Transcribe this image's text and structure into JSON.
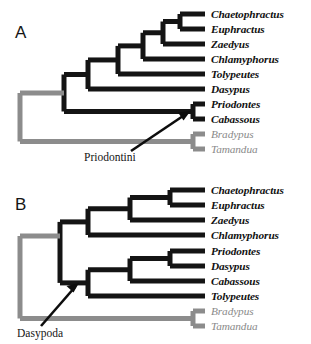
{
  "figure": {
    "type": "cladogram-pair",
    "colors": {
      "ingroup_branch": "#141414",
      "outgroup_branch": "#8c8c8c",
      "ingroup_text": "#111111",
      "outgroup_text": "#8a8a8a",
      "background": "#ffffff"
    }
  },
  "panels": [
    {
      "id": "A",
      "letter": "A",
      "clade_annotation": {
        "label": "Priodontini",
        "points_to": "Priodontes + Cabassous node"
      },
      "tips": [
        {
          "name": "Chaetophractus",
          "group": "ingroup"
        },
        {
          "name": "Euphractus",
          "group": "ingroup"
        },
        {
          "name": "Zaedyus",
          "group": "ingroup"
        },
        {
          "name": "Chlamyphorus",
          "group": "ingroup"
        },
        {
          "name": "Tolypeutes",
          "group": "ingroup"
        },
        {
          "name": "Dasypus",
          "group": "ingroup"
        },
        {
          "name": "Priodontes",
          "group": "ingroup"
        },
        {
          "name": "Cabassous",
          "group": "ingroup"
        },
        {
          "name": "Bradypus",
          "group": "outgroup"
        },
        {
          "name": "Tamandua",
          "group": "outgroup"
        }
      ],
      "newick": "((((((Chaetophractus,Euphractus),Zaedyus),Chlamyphorus),Tolypeutes),Dasypus),(Priodontes,Cabassous)),(Bradypus,Tamandua));"
    },
    {
      "id": "B",
      "letter": "B",
      "clade_annotation": {
        "label": "Dasypoda",
        "points_to": "base of the armadillo ingroup clade"
      },
      "tips": [
        {
          "name": "Chaetophractus",
          "group": "ingroup"
        },
        {
          "name": "Euphractus",
          "group": "ingroup"
        },
        {
          "name": "Zaedyus",
          "group": "ingroup"
        },
        {
          "name": "Chlamyphorus",
          "group": "ingroup"
        },
        {
          "name": "Priodontes",
          "group": "ingroup"
        },
        {
          "name": "Dasypus",
          "group": "ingroup"
        },
        {
          "name": "Cabassous",
          "group": "ingroup"
        },
        {
          "name": "Tolypeutes",
          "group": "ingroup"
        },
        {
          "name": "Bradypus",
          "group": "outgroup"
        },
        {
          "name": "Tamandua",
          "group": "outgroup"
        }
      ],
      "newick": "(((((Chaetophractus,Euphractus),Zaedyus),Chlamyphorus),(((Priodontes,Dasypus),Cabassous),Tolypeutes)),(Bradypus,Tamandua));"
    }
  ]
}
